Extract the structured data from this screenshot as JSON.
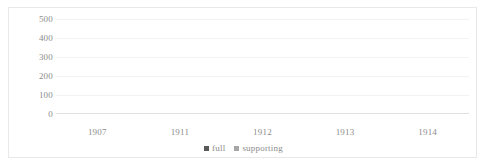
{
  "chart_data": {
    "type": "bar",
    "subtype": "stacked",
    "title": "",
    "xlabel": "",
    "ylabel": "",
    "categories": [
      "1907",
      "1911",
      "1912",
      "1913",
      "1914"
    ],
    "series": [
      {
        "name": "full",
        "values": [
          235,
          275,
          215,
          380,
          405
        ],
        "color": "#595959"
      },
      {
        "name": "supporting",
        "values": [
          15,
          15,
          0,
          0,
          0
        ],
        "color": "#a6a6a6"
      }
    ],
    "totals": [
      250,
      290,
      215,
      380,
      405
    ],
    "ylim": [
      0,
      500
    ],
    "yticks": [
      0,
      100,
      200,
      300,
      400,
      500
    ],
    "ytick_labels": [
      "0",
      "100",
      "200",
      "300",
      "400",
      "500"
    ],
    "grid": true,
    "legend_position": "bottom"
  },
  "legend": {
    "entries": [
      {
        "label": "full",
        "color": "#595959"
      },
      {
        "label": "supporting",
        "color": "#a6a6a6"
      }
    ]
  },
  "colors": {
    "full": "#595959",
    "supporting": "#a6a6a6",
    "gridline": "#f2f2f2",
    "axis": "#e0e0e0",
    "text": "#8c8c8c",
    "frame": "#e8e8e8",
    "background": "#ffffff"
  }
}
